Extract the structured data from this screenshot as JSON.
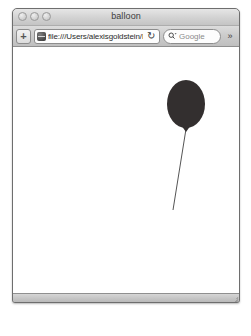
{
  "window": {
    "title": "balloon",
    "traffic_lights": [
      {
        "name": "close",
        "color": "#d2d2d2"
      },
      {
        "name": "minimize",
        "color": "#d2d2d2"
      },
      {
        "name": "zoom",
        "color": "#d2d2d2"
      }
    ]
  },
  "toolbar": {
    "add_tab_label": "+",
    "favicon": "page-globe-icon",
    "url_value": "file:///Users/alexisgoldstein/D",
    "url_placeholder": "Enter address",
    "reload_label": "↻",
    "search_icon": "magnifier-icon",
    "search_placeholder": "Google",
    "search_value": "",
    "overflow_label": "»"
  },
  "content": {
    "description": "black balloon with string on white page",
    "balloon": {
      "fill_color": "#332f2f",
      "center_x": 173,
      "center_y": 57,
      "radius_x": 19,
      "radius_y": 24,
      "knot_x": 173,
      "knot_y": 81
    },
    "string": {
      "color": "#555555",
      "start_x": 173,
      "start_y": 82,
      "end_x": 160,
      "end_y": 163,
      "width": 1
    }
  },
  "status_bar": {
    "text": "",
    "resize_grip": "resize-grip-icon"
  }
}
